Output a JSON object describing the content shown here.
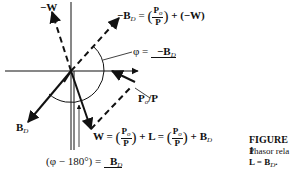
{
  "diagram": {
    "type": "phasor diagram",
    "labels": {
      "neg_w": "−W",
      "neg_bd_eq": "−B",
      "neg_bd_sub": "D",
      "eq_sign": "=",
      "plus_neg_w": "+ (−W)",
      "phi_eq": "φ =",
      "phi_angle": "−B",
      "phi_angle_sub": "D",
      "po_over_p": "P",
      "po_sub": "o",
      "po_tail": "/P",
      "bd": "B",
      "bd_sub": "D",
      "w_eq": "W =",
      "plus_l_eq": "+ L =",
      "plus_bd": "+ B",
      "plus_bd_sub": "D",
      "phi_minus_180": "(φ − 180°) =",
      "angle_bd": "B",
      "angle_bd_sub": "D",
      "frac_num": "P",
      "frac_num_sub": "o",
      "frac_den": "P"
    },
    "caption": {
      "title": "FIGURE 1",
      "line1": "Phasor rela",
      "line2": "L = B",
      "line2_sub": "D",
      "line2_tail": "."
    }
  }
}
